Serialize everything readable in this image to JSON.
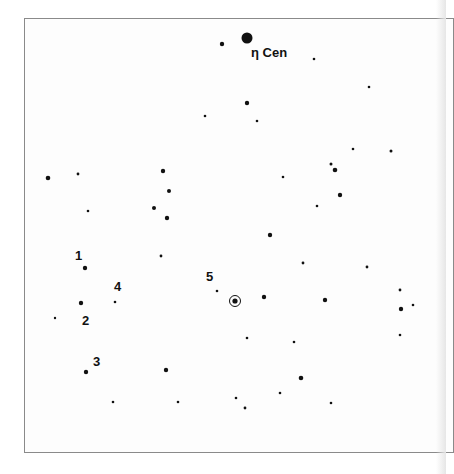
{
  "chart_data": {
    "type": "scatter",
    "title": "",
    "frame": {
      "x": 24,
      "y": 18,
      "width": 430,
      "height": 435
    },
    "reference_star": {
      "name": "η Cen",
      "label_x": 251,
      "label_y": 57,
      "x": 247,
      "y": 38,
      "r": 5.5
    },
    "target": {
      "x": 235,
      "y": 301,
      "r": 2.6,
      "ring_r": 5.5
    },
    "stars": [
      {
        "x": 222,
        "y": 44,
        "r": 2.2
      },
      {
        "x": 314,
        "y": 59,
        "r": 1.3
      },
      {
        "x": 369,
        "y": 87,
        "r": 1.3
      },
      {
        "x": 247,
        "y": 103,
        "r": 2.2
      },
      {
        "x": 205,
        "y": 116,
        "r": 1.3
      },
      {
        "x": 257,
        "y": 121,
        "r": 1.3
      },
      {
        "x": 353,
        "y": 149,
        "r": 1.3
      },
      {
        "x": 391,
        "y": 151,
        "r": 1.5
      },
      {
        "x": 48,
        "y": 178,
        "r": 2.3
      },
      {
        "x": 78,
        "y": 174,
        "r": 1.4
      },
      {
        "x": 163,
        "y": 171,
        "r": 2.2
      },
      {
        "x": 169,
        "y": 191,
        "r": 2.0
      },
      {
        "x": 88,
        "y": 211,
        "r": 1.3
      },
      {
        "x": 154,
        "y": 208,
        "r": 2.0
      },
      {
        "x": 167,
        "y": 218,
        "r": 2.2
      },
      {
        "x": 283,
        "y": 177,
        "r": 1.3
      },
      {
        "x": 331,
        "y": 164,
        "r": 1.5
      },
      {
        "x": 335,
        "y": 170,
        "r": 2.3
      },
      {
        "x": 340,
        "y": 195,
        "r": 2.2
      },
      {
        "x": 317,
        "y": 206,
        "r": 1.3
      },
      {
        "x": 270,
        "y": 235,
        "r": 2.2
      },
      {
        "x": 161,
        "y": 256,
        "r": 1.4
      },
      {
        "x": 303,
        "y": 263,
        "r": 1.4
      },
      {
        "x": 367,
        "y": 267,
        "r": 1.4
      },
      {
        "x": 85,
        "y": 268,
        "r": 2.2
      },
      {
        "x": 81,
        "y": 303,
        "r": 2.2
      },
      {
        "x": 55,
        "y": 318,
        "r": 1.2
      },
      {
        "x": 115,
        "y": 302,
        "r": 1.3
      },
      {
        "x": 217,
        "y": 291,
        "r": 1.3
      },
      {
        "x": 264,
        "y": 297,
        "r": 2.2
      },
      {
        "x": 325,
        "y": 300,
        "r": 2.2
      },
      {
        "x": 400,
        "y": 290,
        "r": 1.4
      },
      {
        "x": 401,
        "y": 309,
        "r": 2.2
      },
      {
        "x": 413,
        "y": 305,
        "r": 1.3
      },
      {
        "x": 400,
        "y": 335,
        "r": 1.3
      },
      {
        "x": 247,
        "y": 338,
        "r": 1.3
      },
      {
        "x": 294,
        "y": 342,
        "r": 1.3
      },
      {
        "x": 86,
        "y": 372,
        "r": 2.2
      },
      {
        "x": 166,
        "y": 370,
        "r": 2.2
      },
      {
        "x": 301,
        "y": 378,
        "r": 2.3
      },
      {
        "x": 113,
        "y": 402,
        "r": 1.3
      },
      {
        "x": 178,
        "y": 402,
        "r": 1.3
      },
      {
        "x": 236,
        "y": 398,
        "r": 1.3
      },
      {
        "x": 245,
        "y": 408,
        "r": 1.4
      },
      {
        "x": 280,
        "y": 393,
        "r": 1.3
      },
      {
        "x": 331,
        "y": 403,
        "r": 1.3
      }
    ],
    "comparison_labels": [
      {
        "text": "1",
        "x": 75,
        "y": 260
      },
      {
        "text": "2",
        "x": 82,
        "y": 325
      },
      {
        "text": "3",
        "x": 93,
        "y": 366
      },
      {
        "text": "4",
        "x": 114,
        "y": 291
      },
      {
        "text": "5",
        "x": 206,
        "y": 281
      }
    ],
    "grid": false,
    "legend": null
  },
  "labels": {
    "reference": "η Cen",
    "c1": "1",
    "c2": "2",
    "c3": "3",
    "c4": "4",
    "c5": "5"
  },
  "colors": {
    "star": "#111111",
    "frame": "#8a8a8a",
    "background": "#ffffff"
  }
}
